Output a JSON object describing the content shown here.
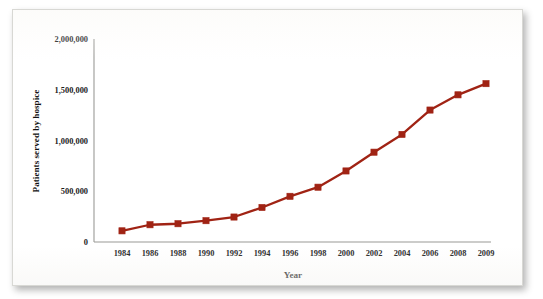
{
  "chart_data": {
    "type": "line",
    "title": "",
    "xlabel": "Year",
    "ylabel": "Patients served by hospice",
    "categories": [
      "1984",
      "1986",
      "1988",
      "1990",
      "1992",
      "1994",
      "1996",
      "1998",
      "2000",
      "2002",
      "2004",
      "2006",
      "2008",
      "2009"
    ],
    "x": [
      1984,
      1986,
      1988,
      1990,
      1992,
      1994,
      1996,
      1998,
      2000,
      2002,
      2004,
      2006,
      2008,
      2009
    ],
    "values": [
      110000,
      170000,
      180000,
      210000,
      246000,
      340000,
      450000,
      540000,
      700000,
      885000,
      1060000,
      1300000,
      1450000,
      1560000
    ],
    "series": [
      {
        "name": "Patients served by hospice",
        "values": [
          110000,
          170000,
          180000,
          210000,
          246000,
          340000,
          450000,
          540000,
          700000,
          885000,
          1060000,
          1300000,
          1450000,
          1560000
        ],
        "color": "#A02314"
      }
    ],
    "ylim": [
      0,
      2000000
    ],
    "ytick_values": [
      0,
      500000,
      1000000,
      1500000,
      2000000
    ],
    "ytick_labels": [
      "0",
      "500,000",
      "1,000,000",
      "1,500,000",
      "2,000,000"
    ],
    "xtick_labels": [
      "1984",
      "1986",
      "1988",
      "1990",
      "1992",
      "1994",
      "1996",
      "1998",
      "2000",
      "2002",
      "2004",
      "2006",
      "2008",
      "2009"
    ],
    "grid": false,
    "legend": "none",
    "marker": "square",
    "line_color": "#A02314",
    "marker_color": "#A02314",
    "axis_color": "#9A9A96",
    "background_color": "#FFFFFF"
  },
  "axis": {
    "y_label": "Patients served by hospice",
    "x_label": "Year"
  }
}
